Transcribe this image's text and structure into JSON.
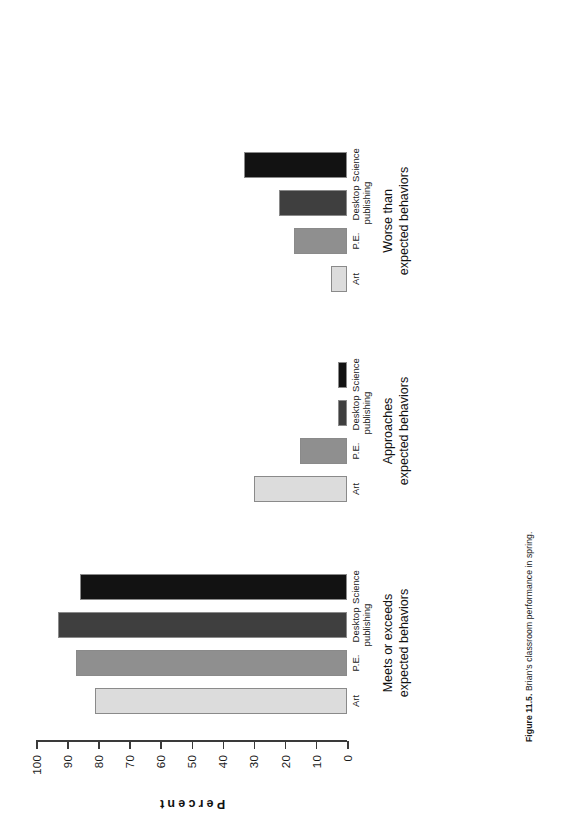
{
  "caption": {
    "number": "Figure 11.5.",
    "text": "Brian's classroom performance in spring."
  },
  "chart_data": {
    "type": "bar",
    "title": "Brian's classroom performance in spring",
    "xlabel": "",
    "ylabel": "Percent",
    "ylim": [
      0,
      100
    ],
    "ytick_labels": [
      "0",
      "10",
      "20",
      "30",
      "40",
      "50",
      "60",
      "70",
      "80",
      "90",
      "100"
    ],
    "grid": false,
    "legend": "none",
    "orientation": "vertical-bars-printed-sideways",
    "categories": [
      "Art",
      "P.E.",
      "Desktop publishing",
      "Science"
    ],
    "groups": [
      {
        "name": "Meets or exceeds\nexpected behaviors",
        "values": [
          81,
          87,
          93,
          86
        ]
      },
      {
        "name": "Approaches\nexpected behaviors",
        "values": [
          30,
          15,
          3,
          3
        ]
      },
      {
        "name": "Worse than\nexpected behaviors",
        "values": [
          5,
          17,
          22,
          33
        ]
      }
    ],
    "series_colors": [
      "#dcdcdc",
      "#8f8f8f",
      "#3f3f3f",
      "#121212"
    ]
  },
  "axis": {
    "title": "Percent",
    "ticks": [
      {
        "label": "100",
        "value": 100
      },
      {
        "label": "90",
        "value": 90
      },
      {
        "label": "80",
        "value": 80
      },
      {
        "label": "70",
        "value": 70
      },
      {
        "label": "60",
        "value": 60
      },
      {
        "label": "50",
        "value": 50
      },
      {
        "label": "40",
        "value": 40
      },
      {
        "label": "30",
        "value": 30
      },
      {
        "label": "20",
        "value": 20
      },
      {
        "label": "10",
        "value": 10
      },
      {
        "label": "0",
        "value": 0
      }
    ]
  },
  "groups": [
    {
      "title": "Meets or exceeds\nexpected behaviors",
      "bars": [
        {
          "label": "Art",
          "value": 81
        },
        {
          "label": "P.E.",
          "value": 87
        },
        {
          "label": "Desktop\npublishing",
          "value": 93
        },
        {
          "label": "Science",
          "value": 86
        }
      ]
    },
    {
      "title": "Approaches\nexpected behaviors",
      "bars": [
        {
          "label": "Art",
          "value": 30
        },
        {
          "label": "P.E.",
          "value": 15
        },
        {
          "label": "Desktop\npublishing",
          "value": 3
        },
        {
          "label": "Science",
          "value": 3
        }
      ]
    },
    {
      "title": "Worse than\nexpected behaviors",
      "bars": [
        {
          "label": "Art",
          "value": 5
        },
        {
          "label": "P.E.",
          "value": 17
        },
        {
          "label": "Desktop\npublishing",
          "value": 22
        },
        {
          "label": "Science",
          "value": 33
        }
      ]
    }
  ]
}
